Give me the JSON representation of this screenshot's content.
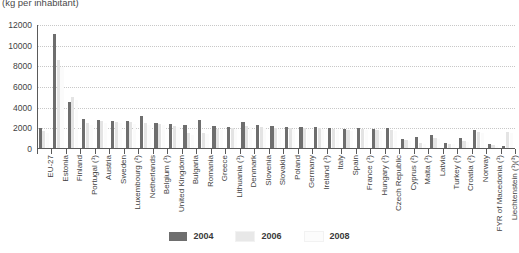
{
  "chart_data": {
    "type": "bar",
    "title": "(kg per inhabitant)",
    "xlabel": "",
    "ylabel": "",
    "ylim": [
      0,
      12000
    ],
    "ytick_step": 2000,
    "yticks": [
      0,
      2000,
      4000,
      6000,
      8000,
      10000,
      12000
    ],
    "ytick_labels": [
      "0",
      "2000",
      "4000",
      "6000",
      "8000",
      "10000",
      "12000"
    ],
    "grid": true,
    "legend_position": "bottom-center",
    "categories": [
      "EU-27",
      "Estonia",
      "Finland",
      "Portugal (¹)",
      "Austria",
      "Sweden",
      "Luxembourg (²)",
      "Netherlands",
      "Belgium (¹)",
      "United Kingdom",
      "Bulgaria",
      "Romania",
      "Greece",
      "Lithuania (¹)",
      "Denmark",
      "Slovenia",
      "Slovakia",
      "Poland",
      "Germany",
      "Ireland (¹)",
      "Italy",
      "Spain",
      "France (¹)",
      "Hungary (¹)",
      "Czech Republic",
      "Cyprus (²)",
      "Malta (¹)",
      "Latvia",
      "Turkey (²)",
      "Croatia (²)",
      "Norway",
      "FYR of Macedonia (¹)",
      "Liechtenstein (¹)(³)"
    ],
    "series": [
      {
        "name": "2004",
        "color": "#6e6e6e",
        "values": [
          1900,
          11000,
          4500,
          2800,
          2750,
          2650,
          2600,
          3100,
          2450,
          2350,
          2250,
          2700,
          2100,
          2000,
          2500,
          2250,
          2100,
          2050,
          2000,
          2050,
          1900,
          1850,
          1900,
          1800,
          1900,
          900,
          1050,
          1300,
          450,
          950,
          1700,
          350,
          150
        ]
      },
      {
        "name": "2006",
        "color": "#e4e4e4",
        "values": [
          1650,
          8500,
          4900,
          2400,
          2600,
          2550,
          2500,
          2400,
          2350,
          2150,
          1450,
          1500,
          1800,
          1950,
          2100,
          2050,
          1950,
          1900,
          1950,
          1950,
          1800,
          1750,
          1800,
          1700,
          1750,
          800,
          500,
          950,
          400,
          700,
          1550,
          250,
          1550
        ]
      },
      {
        "name": "2008",
        "color": "#fbfbfb",
        "values": [
          1500,
          7800,
          4600,
          2200,
          2450,
          2400,
          2300,
          2200,
          2250,
          2000,
          1300,
          1350,
          1700,
          1850,
          2000,
          1950,
          1850,
          1800,
          1850,
          1850,
          1700,
          1650,
          1700,
          1600,
          1650,
          700,
          400,
          850,
          350,
          600,
          1450,
          200,
          1450
        ]
      }
    ]
  },
  "legend": {
    "items": [
      {
        "label": "2004",
        "color": "#6e6e6e"
      },
      {
        "label": "2006",
        "color": "#e8e8e8"
      },
      {
        "label": "2008",
        "color": "#fcfcfc"
      }
    ]
  }
}
